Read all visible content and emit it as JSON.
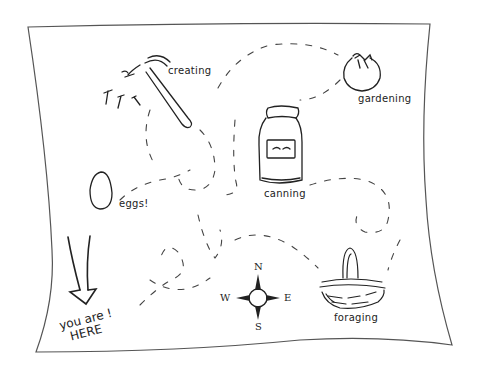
{
  "map": {
    "style": "hand-drawn homestead map",
    "stroke_color": "#2a2a2a",
    "paper_color": "#ffffff",
    "landmarks": [
      {
        "id": "creating",
        "label": "creating",
        "icon": "hammer-icon"
      },
      {
        "id": "gardening",
        "label": "gardening",
        "icon": "tomato-icon"
      },
      {
        "id": "canning",
        "label": "canning",
        "icon": "jar-icon"
      },
      {
        "id": "eggs",
        "label": "eggs!",
        "icon": "egg-icon"
      },
      {
        "id": "foraging",
        "label": "foraging",
        "icon": "basket-icon"
      }
    ],
    "you_are_here": {
      "line1": "you are !",
      "line2": "HERE",
      "icon": "down-arrow-icon"
    },
    "compass": {
      "north": "N",
      "south": "S",
      "east": "E",
      "west": "W"
    }
  }
}
